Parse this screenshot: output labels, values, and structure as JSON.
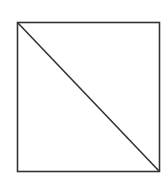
{
  "diagram": {
    "shape": "square-with-diagonal",
    "square": {
      "x": 17.5,
      "y": 22.5,
      "width": 142,
      "height": 149
    },
    "diagonal": {
      "from": "top-left",
      "to": "bottom-right"
    },
    "stroke_color": "#333333",
    "stroke_width": 1.6,
    "background": "#ffffff"
  }
}
